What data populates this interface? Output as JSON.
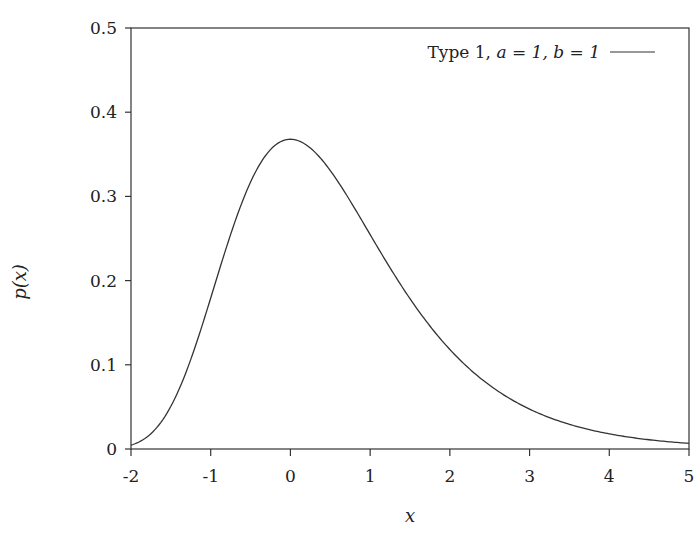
{
  "chart_data": {
    "type": "line",
    "title": "",
    "xlabel": "x",
    "ylabel": "p(x)",
    "xlim": [
      -2,
      5
    ],
    "ylim": [
      0,
      0.5
    ],
    "xticks": [
      -2,
      -1,
      0,
      1,
      2,
      3,
      4,
      5
    ],
    "xtick_labels": [
      "-2",
      "-1",
      "0",
      "1",
      "2",
      "3",
      "4",
      "5"
    ],
    "yticks": [
      0,
      0.1,
      0.2,
      0.3,
      0.4,
      0.5
    ],
    "ytick_labels": [
      "0",
      "0.1",
      "0.2",
      "0.3",
      "0.4",
      "0.5"
    ],
    "grid": false,
    "legend_position": "upper right",
    "series": [
      {
        "name": "Type 1, a = 1, b = 1",
        "color": "#333333",
        "x": [
          -2.0,
          -1.75,
          -1.5,
          -1.25,
          -1.0,
          -0.75,
          -0.5,
          -0.25,
          0.0,
          0.25,
          0.5,
          0.75,
          1.0,
          1.25,
          1.5,
          1.75,
          2.0,
          2.5,
          3.0,
          3.5,
          4.0,
          4.5,
          5.0
        ],
        "values": [
          0.005,
          0.018,
          0.051,
          0.107,
          0.18,
          0.254,
          0.315,
          0.355,
          0.368,
          0.356,
          0.331,
          0.295,
          0.254,
          0.215,
          0.178,
          0.145,
          0.118,
          0.076,
          0.047,
          0.029,
          0.018,
          0.011,
          0.007
        ]
      }
    ]
  },
  "legend": {
    "entry_label_prefix": "Type 1, ",
    "entry_label_math": "a = 1, b = 1"
  },
  "axes": {
    "x_label": "x",
    "y_label": "p(x)"
  }
}
